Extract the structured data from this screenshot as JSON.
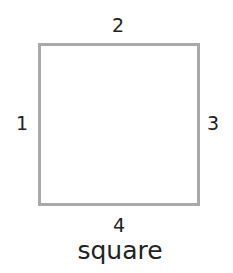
{
  "diagram": {
    "shape_name": "square",
    "border_color": "#a9a9a9",
    "sides": {
      "left": "1",
      "top": "2",
      "right": "3",
      "bottom": "4"
    },
    "caption": "square"
  }
}
